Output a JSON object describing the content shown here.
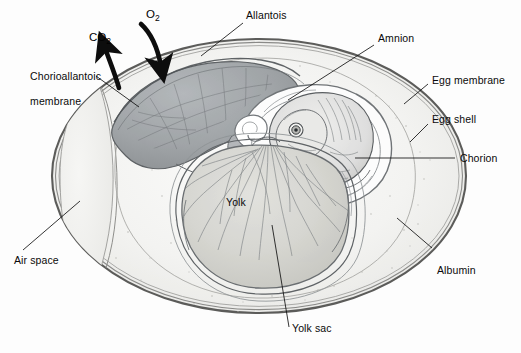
{
  "figure": {
    "kind": "anatomical-illustration",
    "background_color": "#fdfdfd",
    "line_color": "#1a1a1a",
    "label_color": "#0a0a0a"
  },
  "labels": {
    "chorioallantoic_membrane_line1": "Chorioallantoic",
    "chorioallantoic_membrane_line2": "membrane",
    "allantois": "Allantois",
    "amnion": "Amnion",
    "egg_membrane": "Egg membrane",
    "egg_shell": "Egg shell",
    "chorion": "Chorion",
    "albumin": "Albumin",
    "yolk_sac": "Yolk sac",
    "yolk": "Yolk",
    "air_space": "Air space"
  },
  "gases": {
    "carbon_dioxide_text": "CO",
    "carbon_dioxide_sub": "2",
    "oxygen_text": "O",
    "oxygen_sub": "2",
    "carbon_dioxide_direction": "outward-upper-left",
    "oxygen_direction": "inward-lower-right"
  },
  "structures": [
    {
      "name": "egg-shell",
      "fill": "#f2f2f0",
      "stroke": "#4a4a4a",
      "note": "outer oval shell with double membrane line"
    },
    {
      "name": "egg-membrane",
      "fill": "none",
      "stroke": "#6b6b6b",
      "note": "thin line just inside shell"
    },
    {
      "name": "albumin",
      "fill": "#f4f4f2",
      "stroke": "#9a9a9a",
      "note": "speckled egg white filling shell interior"
    },
    {
      "name": "air-space",
      "fill": "#eeeeec",
      "stroke": "#8d8d8d",
      "note": "crescent at blunt left end of egg"
    },
    {
      "name": "chorioallantoic-membrane",
      "fill": "#9fa3a6",
      "stroke": "#5a5e61",
      "note": "dark vascular sheet at upper left beneath shell"
    },
    {
      "name": "allantois",
      "fill": "#a7abae",
      "stroke": "#55595c",
      "note": "dark vascularized sac upper-left of embryo"
    },
    {
      "name": "amnion",
      "fill": "#fbfbfb",
      "stroke": "#6f7376",
      "note": "clear swirled sac enclosing embryo"
    },
    {
      "name": "embryo",
      "fill": "#e6e6e4",
      "stroke": "#53575a",
      "note": "curled chick embryo with visible eye"
    },
    {
      "name": "yolk",
      "fill": "#d8d8d4",
      "stroke": "#6a6e71",
      "note": "large rounded mass in lower center"
    },
    {
      "name": "yolk-sac",
      "fill": "none",
      "stroke": "#5f6366",
      "note": "membrane wrapping the yolk"
    },
    {
      "name": "vitelline-vessels",
      "stroke": "#7b7f82",
      "note": "blood vessels radiating over the yolk surface"
    }
  ]
}
